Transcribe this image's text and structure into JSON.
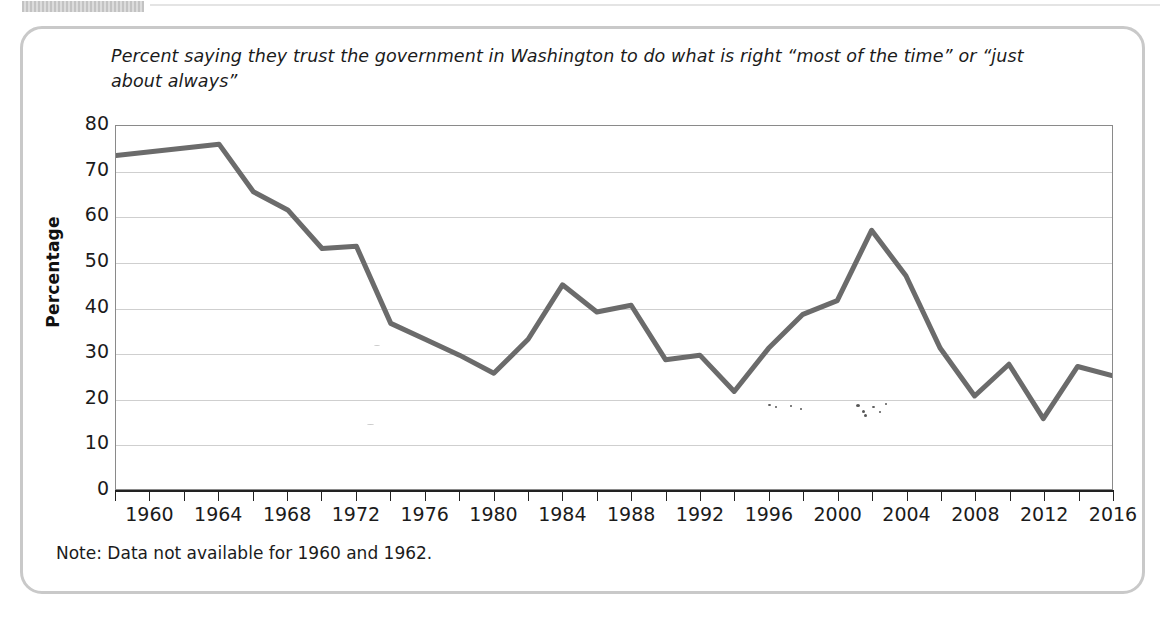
{
  "figure": {
    "title": "Percent saying they trust the government in Washington to do what is right “most of the time” or “just about always”",
    "note": "Note: Data not available for 1960 and 1962."
  },
  "colors": {
    "line": "#6b6b6b",
    "gridline": "#cfcfcf",
    "axis": "#222222",
    "frame_border": "#c9c9c9",
    "text": "#1b1b1b"
  },
  "chart_data": {
    "type": "line",
    "title": "Percent saying they trust the government in Washington to do what is right “most of the time” or “just about always”",
    "xlabel": "",
    "ylabel": "Percentage",
    "xlim": [
      1958,
      2016
    ],
    "ylim": [
      0,
      80
    ],
    "grid": true,
    "legend": "none",
    "y_ticks": [
      80,
      70,
      60,
      50,
      40,
      30,
      20,
      10,
      0
    ],
    "x_tick_labels": [
      "1960",
      "1964",
      "1968",
      "1972",
      "1976",
      "1980",
      "1984",
      "1988",
      "1992",
      "1996",
      "2000",
      "2004",
      "2008",
      "2012",
      "2016"
    ],
    "x_tick_label_years": [
      1960,
      1964,
      1968,
      1972,
      1976,
      1980,
      1984,
      1988,
      1992,
      1996,
      2000,
      2004,
      2008,
      2012,
      2016
    ],
    "x_minor_tick_years": [
      1958,
      1960,
      1962,
      1964,
      1966,
      1968,
      1970,
      1972,
      1974,
      1976,
      1978,
      1980,
      1982,
      1984,
      1986,
      1988,
      1990,
      1992,
      1994,
      1996,
      1998,
      2000,
      2002,
      2004,
      2006,
      2008,
      2010,
      2012,
      2014,
      2016
    ],
    "x": [
      1958,
      1964,
      1966,
      1968,
      1970,
      1972,
      1974,
      1976,
      1978,
      1980,
      1982,
      1984,
      1986,
      1988,
      1990,
      1992,
      1994,
      1996,
      1998,
      2000,
      2002,
      2004,
      2006,
      2008,
      2010,
      2012,
      2014,
      2016
    ],
    "values": [
      73.5,
      76.0,
      65.5,
      61.5,
      53.0,
      53.5,
      36.5,
      33.0,
      29.5,
      25.5,
      33.0,
      45.0,
      39.0,
      40.5,
      28.5,
      29.5,
      21.5,
      31.0,
      38.5,
      41.5,
      57.0,
      47.0,
      31.0,
      20.5,
      27.5,
      15.5,
      27.0,
      25.0
    ],
    "note": "Note: Data not available for 1960 and 1962."
  }
}
